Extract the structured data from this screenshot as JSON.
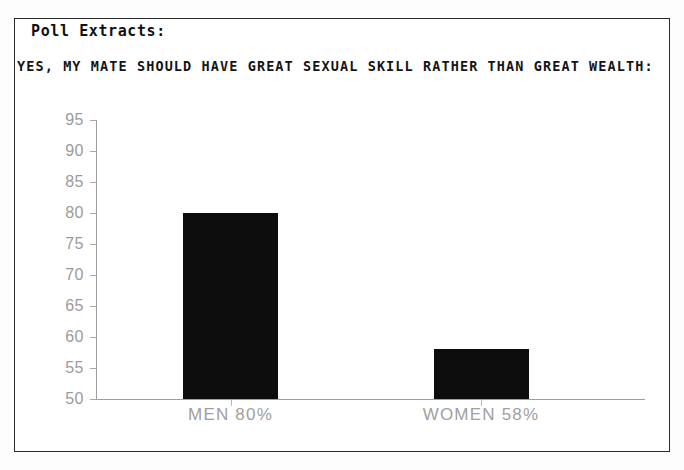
{
  "document": {
    "kicker": "Poll Extracts:",
    "headline": "YES, MY MATE SHOULD HAVE GREAT SEXUAL SKILL RATHER THAN GREAT WEALTH:"
  },
  "colors": {
    "frame": "#2b2b2b",
    "bar": "#0d0d0d",
    "axis": "#9e9e9e",
    "tick_text": "#9b9b9b",
    "label_text": "#a0a0a0",
    "page": "#ffffff"
  },
  "chart_data": {
    "type": "bar",
    "title": "YES, MY MATE SHOULD HAVE GREAT SEXUAL SKILL RATHER THAN GREAT WEALTH:",
    "subtitle": "Poll Extracts:",
    "categories": [
      "MEN",
      "WOMEN"
    ],
    "values": [
      80,
      58
    ],
    "bar_labels": [
      "MEN  80%",
      "WOMEN  58%"
    ],
    "xlabel": "",
    "ylabel": "",
    "ylim": [
      50,
      95
    ],
    "yticks": [
      95,
      90,
      85,
      80,
      75,
      70,
      65,
      60,
      55,
      50
    ],
    "ytick_labels": [
      "95",
      "90",
      "85",
      "80",
      "75",
      "70",
      "65",
      "60",
      "55",
      "50"
    ],
    "grid": false,
    "legend": false,
    "legend_position": "none",
    "units": "percent"
  }
}
